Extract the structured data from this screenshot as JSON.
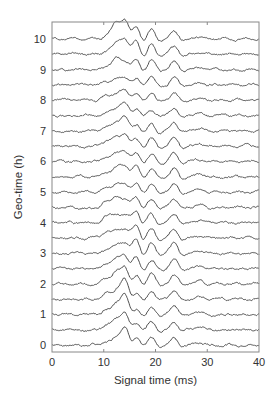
{
  "chart_data": {
    "type": "line",
    "subtype": "stacked waveform traces (offset wiggle plot)",
    "title": "",
    "xlabel": "Signal time (ms)",
    "ylabel": "Geo-time (h)",
    "xlim": [
      0,
      40
    ],
    "ylim": [
      -0.2,
      10.6
    ],
    "x_ticks": [
      0,
      10,
      20,
      30,
      40
    ],
    "y_ticks": [
      0,
      1,
      2,
      3,
      4,
      5,
      6,
      7,
      8,
      9,
      10
    ],
    "grid": false,
    "legend": null,
    "trace_offsets_h": [
      0,
      0.5,
      1,
      1.5,
      2,
      2.5,
      3,
      3.5,
      4,
      4.5,
      5,
      5.5,
      6,
      6.5,
      7,
      7.5,
      8,
      8.5,
      9,
      9.5,
      10
    ],
    "peak_times_ms": [
      10.5,
      12.3,
      14.0,
      16.1,
      19.2,
      23.6,
      28.5
    ],
    "series": [
      {
        "name": "trace_0.0h",
        "offset": 0.0,
        "peak_amplitudes": [
          0.15,
          0.35,
          0.95,
          0.45,
          0.3,
          0.35,
          0.1
        ]
      },
      {
        "name": "trace_0.5h",
        "offset": 0.5,
        "peak_amplitudes": [
          0.2,
          0.45,
          0.95,
          0.45,
          0.35,
          0.35,
          0.12
        ]
      },
      {
        "name": "trace_1.0h",
        "offset": 1.0,
        "peak_amplitudes": [
          0.2,
          0.5,
          1.0,
          0.4,
          0.3,
          0.4,
          0.1
        ]
      },
      {
        "name": "trace_1.5h",
        "offset": 1.5,
        "peak_amplitudes": [
          0.25,
          0.45,
          1.0,
          0.45,
          0.35,
          0.4,
          0.1
        ]
      },
      {
        "name": "trace_2.0h",
        "offset": 2.0,
        "peak_amplitudes": [
          0.2,
          0.6,
          0.9,
          0.5,
          0.55,
          0.4,
          0.12
        ]
      },
      {
        "name": "trace_2.5h",
        "offset": 2.5,
        "peak_amplitudes": [
          0.2,
          0.45,
          0.7,
          0.6,
          0.35,
          0.4,
          0.1
        ]
      },
      {
        "name": "trace_3.0h",
        "offset": 3.0,
        "peak_amplitudes": [
          0.2,
          0.4,
          0.55,
          0.7,
          0.45,
          0.4,
          0.1
        ]
      },
      {
        "name": "trace_3.5h",
        "offset": 3.5,
        "peak_amplitudes": [
          0.25,
          0.4,
          0.5,
          0.65,
          0.4,
          0.4,
          0.1
        ]
      },
      {
        "name": "trace_4.0h",
        "offset": 4.0,
        "peak_amplitudes": [
          0.3,
          0.45,
          0.4,
          0.6,
          0.4,
          0.4,
          0.1
        ]
      },
      {
        "name": "trace_4.5h",
        "offset": 4.5,
        "peak_amplitudes": [
          0.25,
          0.55,
          0.4,
          0.55,
          0.4,
          0.4,
          0.1
        ]
      },
      {
        "name": "trace_5.0h",
        "offset": 5.0,
        "peak_amplitudes": [
          0.2,
          0.4,
          0.45,
          0.45,
          0.4,
          0.4,
          0.1
        ]
      },
      {
        "name": "trace_5.5h",
        "offset": 5.5,
        "peak_amplitudes": [
          0.2,
          0.45,
          0.6,
          0.55,
          0.4,
          0.4,
          0.1
        ]
      },
      {
        "name": "trace_6.0h",
        "offset": 6.0,
        "peak_amplitudes": [
          0.2,
          0.35,
          0.55,
          0.45,
          0.35,
          0.4,
          0.1
        ]
      },
      {
        "name": "trace_6.5h",
        "offset": 6.5,
        "peak_amplitudes": [
          0.2,
          0.4,
          0.65,
          0.4,
          0.35,
          0.4,
          0.1
        ]
      },
      {
        "name": "trace_7.0h",
        "offset": 7.0,
        "peak_amplitudes": [
          0.15,
          0.35,
          0.7,
          0.4,
          0.35,
          0.35,
          0.1
        ]
      },
      {
        "name": "trace_7.5h",
        "offset": 7.5,
        "peak_amplitudes": [
          0.15,
          0.35,
          0.6,
          0.4,
          0.3,
          0.35,
          0.1
        ]
      },
      {
        "name": "trace_8.0h",
        "offset": 8.0,
        "peak_amplitudes": [
          0.2,
          0.3,
          0.5,
          0.35,
          0.35,
          0.35,
          0.1
        ]
      },
      {
        "name": "trace_8.5h",
        "offset": 8.5,
        "peak_amplitudes": [
          0.15,
          0.3,
          0.4,
          0.35,
          0.35,
          0.35,
          0.1
        ]
      },
      {
        "name": "trace_9.0h",
        "offset": 9.0,
        "peak_amplitudes": [
          0.15,
          0.55,
          0.5,
          0.55,
          0.45,
          0.4,
          0.1
        ]
      },
      {
        "name": "trace_9.5h",
        "offset": 9.5,
        "peak_amplitudes": [
          0.15,
          0.5,
          0.8,
          0.75,
          0.45,
          0.35,
          0.1
        ]
      },
      {
        "name": "trace_10.0h",
        "offset": 10.0,
        "peak_amplitudes": [
          0.15,
          0.75,
          1.0,
          0.7,
          0.45,
          0.35,
          0.1
        ]
      }
    ]
  },
  "axes": {
    "xlabel": "Signal time (ms)",
    "ylabel": "Geo-time (h)",
    "x_tick_labels": [
      "0",
      "10",
      "20",
      "30",
      "40"
    ],
    "y_tick_labels": [
      "0",
      "1",
      "2",
      "3",
      "4",
      "5",
      "6",
      "7",
      "8",
      "9",
      "10"
    ]
  },
  "style": {
    "trace_color": "#3a3a3a",
    "axis_color": "#888888",
    "text_color": "#333333"
  }
}
